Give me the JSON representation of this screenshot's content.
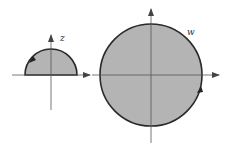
{
  "diagram": {
    "colors": {
      "fill": "#b4b4b4",
      "stroke": "#2a2a2a",
      "axis": "#444444",
      "background": "#ffffff"
    },
    "z_plane": {
      "label": "z",
      "region": "upper half-disk",
      "orientation_arrow": "counterclockwise on arc (upper-left)"
    },
    "w_plane": {
      "label": "w",
      "region": "full disk",
      "orientation_arrow": "counterclockwise on circle (right side, below real axis)"
    }
  }
}
